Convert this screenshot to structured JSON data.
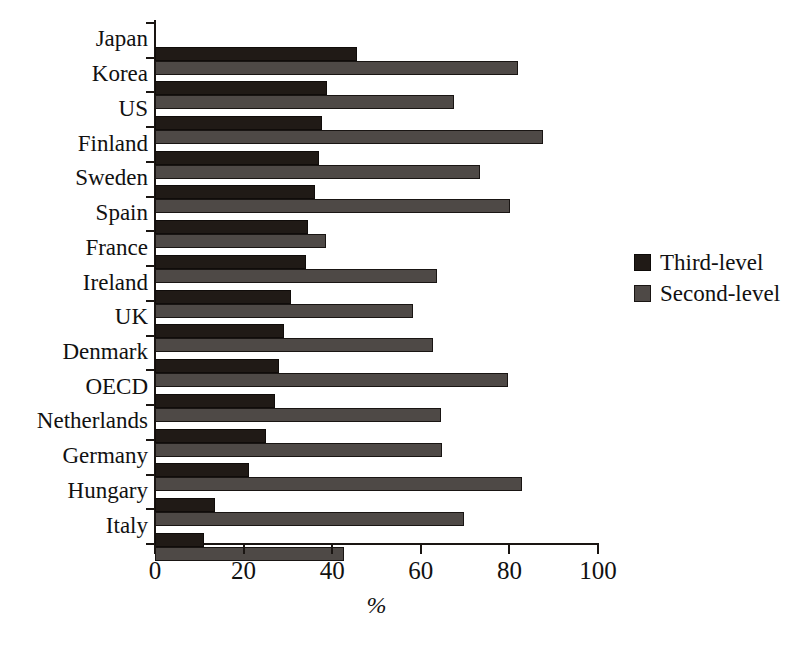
{
  "chart_data": {
    "type": "bar",
    "orientation": "horizontal",
    "title": "",
    "xlabel": "%",
    "ylabel": "",
    "xlim": [
      0,
      100
    ],
    "xticks": [
      0,
      20,
      40,
      60,
      80,
      100
    ],
    "xtick_labels": [
      "0",
      "20",
      "40",
      "60",
      "80",
      "100"
    ],
    "grid": false,
    "legend_position": "right",
    "categories": [
      "Japan",
      "Korea",
      "US",
      "Finland",
      "Sweden",
      "Spain",
      "France",
      "Ireland",
      "UK",
      "Denmark",
      "OECD",
      "Netherlands",
      "Germany",
      "Hungary",
      "Italy"
    ],
    "series": [
      {
        "name": "Third-level",
        "color": "#201a16",
        "values": [
          45.6,
          38.8,
          37.7,
          37.0,
          36.2,
          34.5,
          34.0,
          30.8,
          29.1,
          27.9,
          27.1,
          25.1,
          21.3,
          13.5,
          11.0
        ]
      },
      {
        "name": "Second-level",
        "color": "#4e4946",
        "values": [
          82.0,
          67.6,
          87.5,
          73.4,
          80.2,
          38.7,
          63.7,
          58.3,
          62.7,
          79.6,
          64.6,
          64.8,
          82.8,
          69.8,
          42.6
        ]
      }
    ]
  },
  "legend": {
    "entries": [
      {
        "label": "Third-level",
        "swatch": "third"
      },
      {
        "label": "Second-level",
        "swatch": "second"
      }
    ]
  },
  "axis": {
    "x_title": "%"
  },
  "colors": {
    "third_level": "#201a16",
    "second_level": "#4e4946",
    "axis": "#1a1512",
    "background": "#ffffff"
  }
}
